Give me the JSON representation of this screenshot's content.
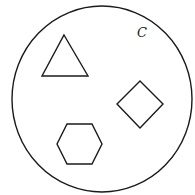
{
  "diagram": {
    "set_label": "C",
    "stroke_color": "#1a1a1a",
    "background": "#ffffff",
    "container": {
      "shape": "circle",
      "cx": 102,
      "cy": 99,
      "rx": 90,
      "ry": 93
    },
    "shapes": [
      {
        "type": "triangle",
        "points": "64,35 88,76 42,76"
      },
      {
        "type": "diamond",
        "points": "140,81 163,104 140,128 117,104"
      },
      {
        "type": "hexagon",
        "points": "57,144 67,124 92,124 102,144 92,164 67,164"
      }
    ],
    "label_position": {
      "x": 137,
      "y": 37
    }
  }
}
